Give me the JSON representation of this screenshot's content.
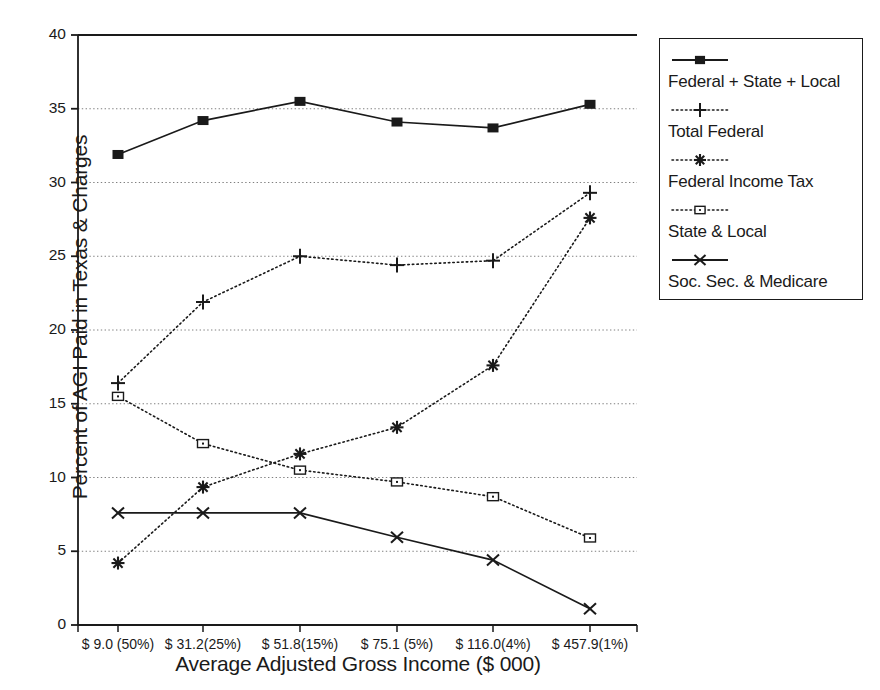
{
  "chart_data": {
    "type": "line",
    "title": "",
    "xlabel": "Average Adjusted Gross Income ($ 000)",
    "ylabel": "Percent of AGI Paid in Texas & Charges",
    "categories": [
      "$ 9.0 (50%)",
      "$ 31.2(25%)",
      "$ 51.8(15%)",
      "$ 75.1 (5%)",
      "$ 116.0(4%)",
      "$ 457.9(1%)"
    ],
    "ylim": [
      0,
      40
    ],
    "yticks": [
      "0",
      "5",
      "10",
      "15",
      "20",
      "25",
      "30",
      "35",
      "40"
    ],
    "grid": true,
    "legend_position": "right",
    "series": [
      {
        "name": "Federal + State + Local",
        "marker": "filled-square",
        "line": "solid",
        "values": [
          31.9,
          34.2,
          35.5,
          34.1,
          33.7,
          35.3
        ]
      },
      {
        "name": "Total Federal",
        "marker": "plus",
        "line": "dotted",
        "values": [
          16.4,
          21.9,
          25.0,
          24.4,
          24.7,
          29.3
        ]
      },
      {
        "name": "Federal Income Tax",
        "marker": "asterisk",
        "line": "dotted",
        "values": [
          4.2,
          9.35,
          11.6,
          13.4,
          17.6,
          27.6
        ]
      },
      {
        "name": "State & Local",
        "marker": "open-square",
        "line": "dotted",
        "values": [
          15.5,
          12.3,
          10.5,
          9.7,
          8.7,
          5.9
        ]
      },
      {
        "name": "Soc. Sec. & Medicare",
        "marker": "cross-x",
        "line": "solid",
        "values": [
          7.6,
          7.6,
          7.6,
          5.95,
          4.4,
          1.1
        ]
      }
    ],
    "colors": {
      "ink": "#1a1a1a",
      "grid": "#808080",
      "background": "#ffffff"
    }
  }
}
